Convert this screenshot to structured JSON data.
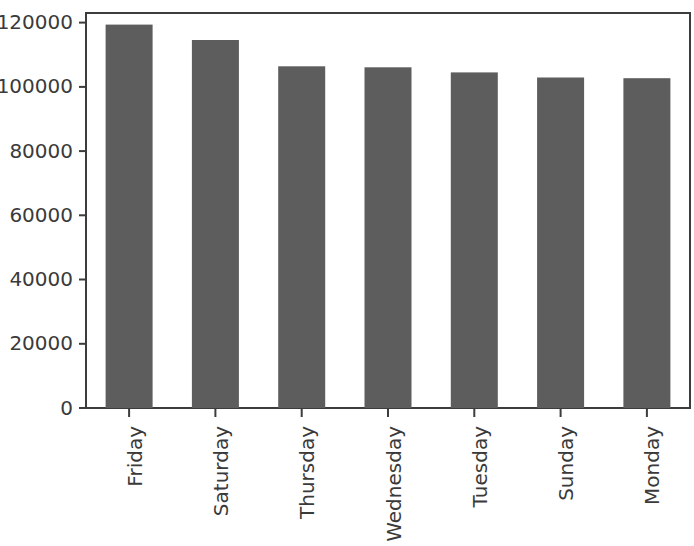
{
  "chart_data": {
    "type": "bar",
    "title": "",
    "subtitle": "",
    "xlabel": "",
    "ylabel": "",
    "categories": [
      "Friday",
      "Saturday",
      "Thursday",
      "Wednesday",
      "Tuesday",
      "Sunday",
      "Monday"
    ],
    "values": [
      119400,
      114600,
      106400,
      106100,
      104500,
      102900,
      102700
    ],
    "series": [
      {
        "name": "count",
        "values": [
          119400,
          114600,
          106400,
          106100,
          104500,
          102900,
          102700
        ]
      }
    ],
    "ylim": [
      0,
      123000
    ],
    "yticks": [
      0,
      20000,
      40000,
      60000,
      80000,
      100000,
      120000
    ],
    "ytick_labels": [
      "0",
      "20000",
      "40000",
      "60000",
      "80000",
      "100000",
      "120000"
    ],
    "xtick_labels": [
      "Friday",
      "Saturday",
      "Thursday",
      "Wednesday",
      "Tuesday",
      "Sunday",
      "Monday"
    ],
    "xtick_rotation": -90,
    "grid": false,
    "legend": false,
    "legend_position": "none",
    "bar_color": "#5d5d5d",
    "axis_color": "#3c3c3c",
    "background_color": "#ffffff",
    "annotations": []
  }
}
